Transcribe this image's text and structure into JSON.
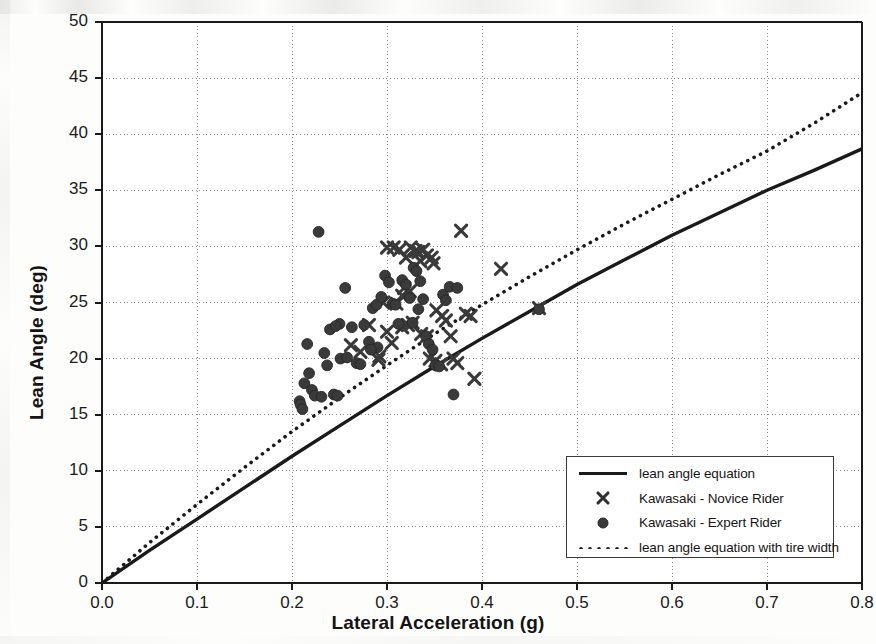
{
  "chart_data": {
    "type": "scatter",
    "title": "",
    "xlabel": "Lateral Acceleration (g)",
    "ylabel": "Lean Angle (deg)",
    "xlim": [
      0.0,
      0.8
    ],
    "ylim": [
      0,
      50
    ],
    "xticks": [
      "0.0",
      "0.1",
      "0.2",
      "0.3",
      "0.4",
      "0.5",
      "0.6",
      "0.7",
      "0.8"
    ],
    "xtick_values": [
      0.0,
      0.1,
      0.2,
      0.3,
      0.4,
      0.5,
      0.6,
      0.7,
      0.8
    ],
    "yticks": [
      "0",
      "5",
      "10",
      "15",
      "20",
      "25",
      "30",
      "35",
      "40",
      "45",
      "50"
    ],
    "ytick_values": [
      0,
      5,
      10,
      15,
      20,
      25,
      30,
      35,
      40,
      45,
      50
    ],
    "grid": true,
    "grid_style": "dotted",
    "legend_position": "lower-right",
    "series": [
      {
        "name": "lean angle equation",
        "type": "line",
        "style": "solid",
        "color": "#1a1a1a",
        "points": [
          [
            0.0,
            0.0
          ],
          [
            0.05,
            2.9
          ],
          [
            0.1,
            5.7
          ],
          [
            0.15,
            8.5
          ],
          [
            0.2,
            11.3
          ],
          [
            0.25,
            14.0
          ],
          [
            0.3,
            16.7
          ],
          [
            0.35,
            19.3
          ],
          [
            0.4,
            21.8
          ],
          [
            0.45,
            24.2
          ],
          [
            0.5,
            26.6
          ],
          [
            0.55,
            28.8
          ],
          [
            0.6,
            31.0
          ],
          [
            0.65,
            33.0
          ],
          [
            0.7,
            35.0
          ],
          [
            0.75,
            36.8
          ],
          [
            0.8,
            38.7
          ]
        ]
      },
      {
        "name": "lean angle equation with tire width",
        "type": "line",
        "style": "dotted",
        "color": "#1a1a1a",
        "points": [
          [
            0.0,
            0.0
          ],
          [
            0.05,
            3.6
          ],
          [
            0.1,
            7.0
          ],
          [
            0.15,
            10.3
          ],
          [
            0.2,
            13.5
          ],
          [
            0.25,
            16.5
          ],
          [
            0.3,
            19.4
          ],
          [
            0.35,
            22.2
          ],
          [
            0.4,
            24.8
          ],
          [
            0.45,
            27.3
          ],
          [
            0.5,
            29.7
          ],
          [
            0.55,
            32.0
          ],
          [
            0.6,
            34.2
          ],
          [
            0.65,
            36.4
          ],
          [
            0.7,
            38.5
          ],
          [
            0.75,
            41.0
          ],
          [
            0.8,
            43.7
          ]
        ]
      },
      {
        "name": "Kawasaki - Novice Rider",
        "type": "scatter",
        "marker": "x",
        "color": "#3a3a3a",
        "points": [
          [
            0.262,
            21.2
          ],
          [
            0.272,
            20.6
          ],
          [
            0.281,
            23.0
          ],
          [
            0.292,
            20.2
          ],
          [
            0.3,
            29.9
          ],
          [
            0.307,
            29.9
          ],
          [
            0.313,
            29.7
          ],
          [
            0.318,
            26.3
          ],
          [
            0.32,
            29.0
          ],
          [
            0.325,
            29.9
          ],
          [
            0.33,
            29.6
          ],
          [
            0.333,
            29.5
          ],
          [
            0.335,
            28.7
          ],
          [
            0.338,
            29.7
          ],
          [
            0.342,
            29.2
          ],
          [
            0.347,
            29.0
          ],
          [
            0.349,
            28.5
          ],
          [
            0.31,
            24.9
          ],
          [
            0.316,
            22.8
          ],
          [
            0.322,
            23.0
          ],
          [
            0.327,
            23.2
          ],
          [
            0.3,
            22.4
          ],
          [
            0.305,
            21.4
          ],
          [
            0.296,
            25.0
          ],
          [
            0.352,
            24.3
          ],
          [
            0.358,
            23.8
          ],
          [
            0.362,
            23.4
          ],
          [
            0.367,
            22.0
          ],
          [
            0.37,
            20.0
          ],
          [
            0.374,
            19.6
          ],
          [
            0.378,
            31.4
          ],
          [
            0.383,
            24.0
          ],
          [
            0.388,
            23.8
          ],
          [
            0.392,
            18.2
          ],
          [
            0.345,
            20.0
          ],
          [
            0.351,
            19.8
          ],
          [
            0.357,
            19.5
          ],
          [
            0.291,
            19.9
          ],
          [
            0.336,
            22.2
          ],
          [
            0.342,
            22.0
          ],
          [
            0.42,
            28.0
          ],
          [
            0.46,
            24.5
          ],
          [
            0.316,
            25.6
          ],
          [
            0.324,
            26.0
          ]
        ]
      },
      {
        "name": "Kawasaki - Expert Rider",
        "type": "scatter",
        "marker": "circle",
        "color": "#3a3a3a",
        "points": [
          [
            0.228,
            31.3
          ],
          [
            0.216,
            21.3
          ],
          [
            0.208,
            16.2
          ],
          [
            0.209,
            15.9
          ],
          [
            0.211,
            15.5
          ],
          [
            0.213,
            17.8
          ],
          [
            0.218,
            18.7
          ],
          [
            0.221,
            17.2
          ],
          [
            0.224,
            16.7
          ],
          [
            0.231,
            16.6
          ],
          [
            0.234,
            20.5
          ],
          [
            0.237,
            19.4
          ],
          [
            0.24,
            22.6
          ],
          [
            0.244,
            16.8
          ],
          [
            0.248,
            16.7
          ],
          [
            0.251,
            20.0
          ],
          [
            0.256,
            26.3
          ],
          [
            0.258,
            20.1
          ],
          [
            0.263,
            22.8
          ],
          [
            0.268,
            19.6
          ],
          [
            0.272,
            19.5
          ],
          [
            0.276,
            23.0
          ],
          [
            0.281,
            21.5
          ],
          [
            0.285,
            24.5
          ],
          [
            0.289,
            24.8
          ],
          [
            0.294,
            25.5
          ],
          [
            0.298,
            27.4
          ],
          [
            0.302,
            26.8
          ],
          [
            0.306,
            24.9
          ],
          [
            0.309,
            24.8
          ],
          [
            0.312,
            23.1
          ],
          [
            0.316,
            27.0
          ],
          [
            0.32,
            26.6
          ],
          [
            0.324,
            25.4
          ],
          [
            0.328,
            28.1
          ],
          [
            0.331,
            27.8
          ],
          [
            0.335,
            26.9
          ],
          [
            0.338,
            25.3
          ],
          [
            0.341,
            22.0
          ],
          [
            0.344,
            21.3
          ],
          [
            0.348,
            20.8
          ],
          [
            0.351,
            19.4
          ],
          [
            0.355,
            19.3
          ],
          [
            0.359,
            25.7
          ],
          [
            0.362,
            25.2
          ],
          [
            0.366,
            26.4
          ],
          [
            0.37,
            16.8
          ],
          [
            0.374,
            26.3
          ],
          [
            0.29,
            21.0
          ],
          [
            0.283,
            20.8
          ],
          [
            0.25,
            23.1
          ],
          [
            0.246,
            22.9
          ],
          [
            0.46,
            24.4
          ],
          [
            0.333,
            24.4
          ],
          [
            0.327,
            23.2
          ]
        ]
      }
    ]
  },
  "legend": {
    "items": [
      {
        "key": "solid-line",
        "label": "lean angle equation"
      },
      {
        "key": "x-marker",
        "label": "Kawasaki - Novice Rider"
      },
      {
        "key": "circle-marker",
        "label": "Kawasaki - Expert Rider"
      },
      {
        "key": "dotted-line",
        "label": "lean angle equation with tire width"
      }
    ]
  },
  "colors": {
    "axis": "#1a1a1a",
    "grid": "#8c8c8c",
    "marker": "#3a3a3a",
    "legend_border": "#3a3a3a"
  }
}
